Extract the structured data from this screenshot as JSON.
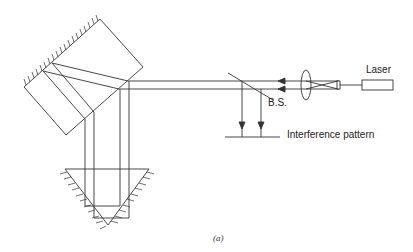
{
  "diagram": {
    "labels": {
      "laser": "Laser",
      "beam_splitter": "B.S.",
      "interference": "Interference pattern",
      "caption": "(a)"
    },
    "colors": {
      "line": "#333333",
      "background": "#ffffff"
    },
    "components": [
      "tilted-mirror-block",
      "corner-cube-reflector",
      "beam-splitter",
      "lens",
      "pinhole-expander",
      "laser",
      "screen"
    ]
  }
}
